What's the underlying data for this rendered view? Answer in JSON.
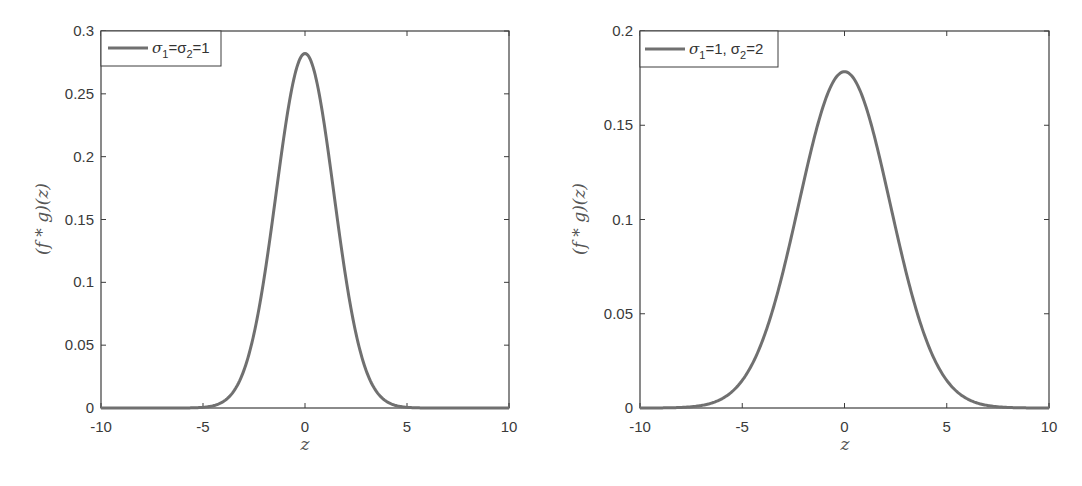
{
  "chart_data": [
    {
      "type": "line",
      "title": "",
      "xlabel": "z",
      "ylabel": "(f * g)(z)",
      "xlim": [
        -10,
        10
      ],
      "ylim": [
        0,
        0.3
      ],
      "xticks": [
        "-10",
        "-5",
        "0",
        "5",
        "10"
      ],
      "yticks": [
        "0",
        "0.05",
        "0.1",
        "0.15",
        "0.2",
        "0.25",
        "0.3"
      ],
      "grid": false,
      "legend_position": "upper-left",
      "legend": [
        {
          "label": "σ1=σ2=1",
          "label_parts": [
            "σ",
            "1",
            "=σ",
            "2",
            "=1"
          ]
        }
      ],
      "series": [
        {
          "name": "σ1=σ2=1",
          "color": "#707070",
          "distribution": "normal",
          "mean": 0,
          "variance": 2,
          "x": [
            -10,
            -8,
            -6,
            -5,
            -4,
            -3.5,
            -3,
            -2.5,
            -2,
            -1.5,
            -1,
            -0.5,
            0,
            0.5,
            1,
            1.5,
            2,
            2.5,
            3,
            3.5,
            4,
            5,
            6,
            8,
            10
          ],
          "y": [
            0.0,
            0.0,
            0.0,
            0.0011,
            0.0052,
            0.0132,
            0.0297,
            0.0589,
            0.1038,
            0.1613,
            0.2197,
            0.265,
            0.2821,
            0.265,
            0.2197,
            0.1613,
            0.1038,
            0.0589,
            0.0297,
            0.0132,
            0.0052,
            0.0011,
            0.0,
            0.0,
            0.0
          ]
        }
      ]
    },
    {
      "type": "line",
      "title": "",
      "xlabel": "z",
      "ylabel": "(f * g)(z)",
      "xlim": [
        -10,
        10
      ],
      "ylim": [
        0,
        0.2
      ],
      "xticks": [
        "-10",
        "-5",
        "0",
        "5",
        "10"
      ],
      "yticks": [
        "0",
        "0.05",
        "0.1",
        "0.15",
        "0.2"
      ],
      "grid": false,
      "legend_position": "upper-left",
      "legend": [
        {
          "label": "σ1=1, σ2=2",
          "label_parts": [
            "σ",
            "1",
            "=1, σ",
            "2",
            "=2"
          ]
        }
      ],
      "series": [
        {
          "name": "σ1=1, σ2=2",
          "color": "#707070",
          "distribution": "normal",
          "mean": 0,
          "variance": 5,
          "x": [
            -10,
            -8,
            -7,
            -6,
            -5,
            -4,
            -3,
            -2,
            -1,
            0,
            1,
            2,
            3,
            4,
            5,
            6,
            7,
            8,
            10
          ],
          "y": [
            0.0,
            0.0003,
            0.0013,
            0.0048,
            0.0146,
            0.036,
            0.0725,
            0.1196,
            0.1614,
            0.1784,
            0.1614,
            0.1196,
            0.0725,
            0.036,
            0.0146,
            0.0048,
            0.0013,
            0.0003,
            0.0
          ]
        }
      ]
    }
  ],
  "left": {
    "ylabel": "(f * g)(z)",
    "xlabel": "z",
    "legend": {
      "s1": "σ",
      "sub1": "1",
      "mid": "=σ",
      "sub2": "2",
      "end": "=1"
    },
    "yticks": [
      "0",
      "0.05",
      "0.1",
      "0.15",
      "0.2",
      "0.25",
      "0.3"
    ],
    "xticks": [
      "-10",
      "-5",
      "0",
      "5",
      "10"
    ],
    "line_color": "#707070"
  },
  "right": {
    "ylabel": "(f * g)(z)",
    "xlabel": "z",
    "legend": {
      "s1": "σ",
      "sub1": "1",
      "mid": "=1, σ",
      "sub2": "2",
      "end": "=2"
    },
    "yticks": [
      "0",
      "0.05",
      "0.1",
      "0.15",
      "0.2"
    ],
    "xticks": [
      "-10",
      "-5",
      "0",
      "5",
      "10"
    ],
    "line_color": "#707070"
  }
}
